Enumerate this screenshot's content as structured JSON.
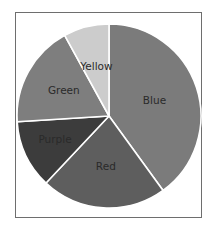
{
  "chart_data": {
    "type": "pie",
    "title": "",
    "start_angle_deg": 0,
    "direction": "clockwise",
    "legend": "none (inline labels)",
    "slices": [
      {
        "label": "Blue",
        "value": 40,
        "color": "#7b7b7b"
      },
      {
        "label": "Red",
        "value": 22,
        "color": "#5e5e5e"
      },
      {
        "label": "Purple",
        "value": 12,
        "color": "#3c3c3c"
      },
      {
        "label": "Green",
        "value": 18,
        "color": "#7e7e7e"
      },
      {
        "label": "Yellow",
        "value": 8,
        "color": "#cccccc"
      }
    ],
    "categories": [
      "Blue",
      "Red",
      "Purple",
      "Green",
      "Yellow"
    ],
    "values": [
      40,
      22,
      12,
      18,
      8
    ]
  },
  "colors": {
    "frame_border": "#6e6e6e",
    "slice_separator": "#ffffff",
    "label_text": "#2a2a2a"
  }
}
